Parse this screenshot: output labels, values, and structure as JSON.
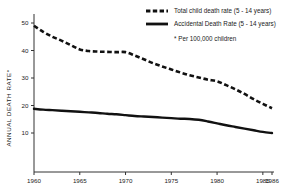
{
  "chart_data": {
    "type": "line",
    "title": "",
    "xlabel": "",
    "ylabel": "ANNUAL DEATH RATE*",
    "xlim": [
      1960,
      1986
    ],
    "ylim": [
      0,
      52
    ],
    "grid": false,
    "legend_position": "top-right",
    "x_ticks": [
      "1960",
      "1965",
      "1970",
      "1975",
      "1980",
      "1985",
      "1986"
    ],
    "x_tick_values": [
      1960,
      1965,
      1970,
      1975,
      1980,
      1985,
      1986
    ],
    "y_ticks": [
      "10",
      "20",
      "30",
      "40",
      "50"
    ],
    "y_tick_values": [
      10,
      20,
      30,
      40,
      50
    ],
    "footnote": "* Per 100,000 children",
    "series": [
      {
        "name": "Total child death rate (5 - 14 years)",
        "style": "dashed",
        "color": "#111111",
        "x": [
          1960,
          1961,
          1962,
          1963,
          1964,
          1965,
          1966,
          1967,
          1968,
          1969,
          1970,
          1971,
          1972,
          1973,
          1974,
          1975,
          1976,
          1977,
          1978,
          1979,
          1980,
          1981,
          1982,
          1983,
          1984,
          1985,
          1986
        ],
        "values": [
          49.0,
          46.8,
          45.0,
          43.6,
          42.0,
          40.4,
          39.8,
          39.6,
          39.5,
          39.4,
          39.4,
          38.2,
          36.8,
          35.4,
          34.2,
          33.1,
          32.0,
          31.0,
          30.2,
          29.4,
          28.8,
          27.4,
          25.9,
          24.2,
          22.3,
          20.6,
          19.0
        ]
      },
      {
        "name": "Accidental Death Rate (5 - 14 years)",
        "style": "solid",
        "color": "#111111",
        "x": [
          1960,
          1961,
          1962,
          1963,
          1964,
          1965,
          1966,
          1967,
          1968,
          1969,
          1970,
          1971,
          1972,
          1973,
          1974,
          1975,
          1976,
          1977,
          1978,
          1979,
          1980,
          1981,
          1982,
          1983,
          1984,
          1985,
          1986
        ],
        "values": [
          18.8,
          18.5,
          18.3,
          18.1,
          17.9,
          17.7,
          17.5,
          17.3,
          17.0,
          16.8,
          16.5,
          16.2,
          16.0,
          15.8,
          15.6,
          15.4,
          15.2,
          15.1,
          14.8,
          14.2,
          13.5,
          12.8,
          12.2,
          11.6,
          11.0,
          10.4,
          10.0
        ]
      }
    ]
  },
  "legend": {
    "items": [
      {
        "label": "Total child death rate (5 - 14 years)",
        "style": "dashed"
      },
      {
        "label": "Accidental Death Rate (5 - 14 years)",
        "style": "solid"
      }
    ],
    "footnote": "* Per 100,000 children"
  }
}
